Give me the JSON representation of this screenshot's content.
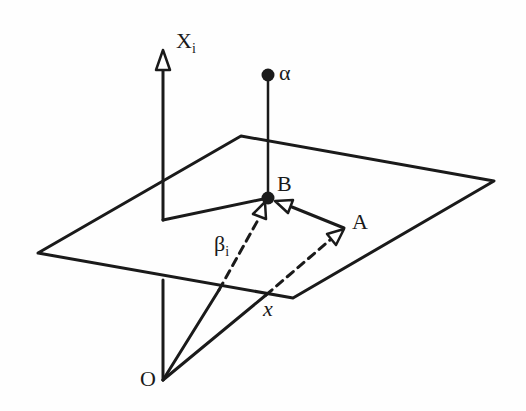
{
  "diagram": {
    "type": "geometric-vector-diagram",
    "colors": {
      "stroke": "#1a1a1a",
      "background": "#fefefe"
    },
    "labels": {
      "axis": {
        "main": "X",
        "sub": "i"
      },
      "alpha": "α",
      "B": "B",
      "A": "A",
      "beta": {
        "main": "β",
        "sub": "i"
      },
      "x": "x",
      "O": "O"
    },
    "points": {
      "O": [
        163,
        380
      ],
      "A": [
        344,
        228
      ],
      "B": [
        268,
        198
      ],
      "alpha": [
        268,
        75
      ],
      "axis_tip": [
        163,
        50
      ],
      "axis_corner": [
        163,
        220
      ]
    },
    "plane": [
      [
        38,
        253
      ],
      [
        241,
        136
      ],
      [
        494,
        181
      ],
      [
        293,
        298
      ]
    ],
    "edges": [
      {
        "from": "O",
        "to": "axis_tip",
        "style": "solid",
        "arrow": "open-triangle",
        "note": "X_i axis (hidden inside plane)"
      },
      {
        "from": "axis_corner",
        "to": "B",
        "style": "solid"
      },
      {
        "from": "alpha",
        "to": "B",
        "style": "solid"
      },
      {
        "from": "A",
        "to": "B",
        "style": "solid",
        "arrow": "open-triangle"
      },
      {
        "from": "O",
        "to": "B",
        "style": "solid-then-dashed",
        "arrow": "open-triangle",
        "label": "β_i"
      },
      {
        "from": "O",
        "to": "A",
        "style": "solid-then-dashed",
        "arrow": "open-triangle",
        "label": "x"
      }
    ]
  }
}
